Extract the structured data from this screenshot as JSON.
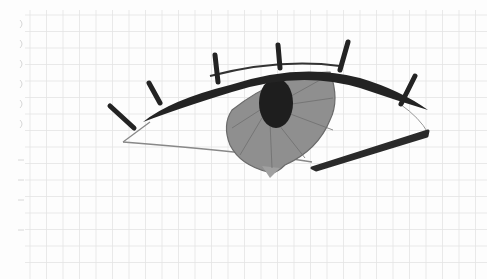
{
  "image": {
    "subject": "pencil sketch of an eye on grid paper",
    "paper_color": "#fdfdfd",
    "grid_color": "#e3e3e3",
    "ink_color": "#232323",
    "iris_color": "#8f8f8f",
    "pupil_color": "#1e1e1e",
    "outline_color": "#777777",
    "lash_count": 7
  }
}
